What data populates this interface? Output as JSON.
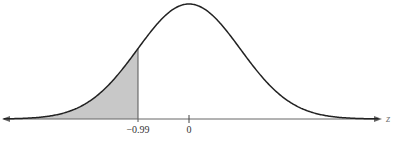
{
  "chart_data": {
    "type": "area",
    "title": "",
    "xlabel": "z",
    "ylabel": "",
    "tick_labels": [
      "-0.99",
      "0"
    ],
    "ticks": [
      -0.99,
      0
    ],
    "shaded_region": {
      "from": "-inf",
      "to": -0.99,
      "side": "left"
    },
    "mean": 0,
    "sd": 1,
    "colors": {
      "curve": "#222222",
      "shade": "#c8c8c8",
      "axis": "#555555"
    }
  },
  "axis": {
    "z_label": "z",
    "tick_neg": "−0.99",
    "tick_zero": "0"
  }
}
